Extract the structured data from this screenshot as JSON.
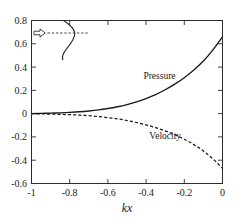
{
  "chart_data": {
    "type": "line",
    "title": "",
    "subtitle": "",
    "xlabel": "kx",
    "ylabel": "",
    "xlim": [
      -1,
      0
    ],
    "ylim": [
      -0.6,
      0.8
    ],
    "grid": false,
    "legend_position": "inline-annotation",
    "x_ticks": [
      "-1",
      "-0.8",
      "-0.6",
      "-0.4",
      "-0.2",
      "0"
    ],
    "x_tick_values": [
      -1,
      -0.8,
      -0.6,
      -0.4,
      -0.2,
      0
    ],
    "y_ticks": [
      "0.8",
      "0.6",
      "0.4",
      "0.2",
      "0",
      "-0.2",
      "-0.4",
      "-0.6"
    ],
    "y_tick_values": [
      0.8,
      0.6,
      0.4,
      0.2,
      0,
      -0.2,
      -0.4,
      -0.6
    ],
    "x": [
      -1.0,
      -0.95,
      -0.9,
      -0.85,
      -0.8,
      -0.75,
      -0.7,
      -0.65,
      -0.6,
      -0.55,
      -0.5,
      -0.45,
      -0.4,
      -0.35,
      -0.3,
      -0.25,
      -0.2,
      -0.15,
      -0.1,
      -0.05,
      0.0
    ],
    "series": [
      {
        "name": "Pressure",
        "style": "solid",
        "color": "#1a1a1a",
        "values": [
          0.0,
          0.002,
          0.004,
          0.007,
          0.011,
          0.016,
          0.023,
          0.032,
          0.044,
          0.059,
          0.078,
          0.101,
          0.13,
          0.164,
          0.205,
          0.253,
          0.309,
          0.375,
          0.452,
          0.548,
          0.66
        ],
        "label_x": -0.33,
        "label_y": 0.3
      },
      {
        "name": "Velocity",
        "style": "dashed",
        "color": "#1a1a1a",
        "values": [
          0.0,
          -0.002,
          -0.004,
          -0.006,
          -0.009,
          -0.013,
          -0.018,
          -0.025,
          -0.034,
          -0.045,
          -0.059,
          -0.076,
          -0.096,
          -0.12,
          -0.148,
          -0.181,
          -0.22,
          -0.266,
          -0.321,
          -0.388,
          -0.47
        ],
        "label_x": -0.3,
        "label_y": -0.215
      }
    ],
    "annotations": [
      {
        "name": "inset-schematic",
        "description": "incoming-wave arrow with dashed axis and S-shaped horn profile",
        "arrow_glyph": "right-arrow",
        "axis_style": "dashed",
        "shape": "s-curve-horn"
      }
    ]
  }
}
